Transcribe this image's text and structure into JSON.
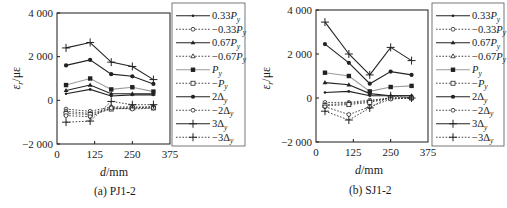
{
  "chart_data": [
    {
      "type": "line",
      "title": "(a) PJ1-2",
      "xlabel": "d/mm",
      "ylabel": "εr/με",
      "xlim": [
        0,
        375
      ],
      "ylim": [
        -2000,
        4000
      ],
      "xticks": [
        0,
        125,
        250,
        375
      ],
      "yticks": [
        -2000,
        0,
        2000,
        4000
      ],
      "ytick_labels": [
        "−2 000",
        "0",
        "2 000",
        "4 000"
      ],
      "grid": false,
      "legend_position": "right",
      "x": [
        30,
        110,
        180,
        250,
        320
      ],
      "series": [
        {
          "name": "0.33Py",
          "style": "solid",
          "marker": "dot",
          "values": [
            300,
            500,
            200,
            250,
            250
          ]
        },
        {
          "name": "-0.33Py",
          "style": "dotted",
          "marker": "open-circle",
          "values": [
            -400,
            -500,
            -300,
            -300,
            -300
          ]
        },
        {
          "name": "0.67Py",
          "style": "solid",
          "marker": "triangle",
          "values": [
            450,
            700,
            300,
            300,
            300
          ]
        },
        {
          "name": "-0.67Py",
          "style": "dotted",
          "marker": "open-triangle",
          "values": [
            -500,
            -600,
            -350,
            -350,
            -300
          ]
        },
        {
          "name": "Py",
          "style": "solid-gray",
          "marker": "square",
          "values": [
            700,
            1000,
            500,
            600,
            400
          ]
        },
        {
          "name": "-Py",
          "style": "dotted",
          "marker": "open-square",
          "values": [
            -600,
            -650,
            -400,
            -350,
            -350
          ]
        },
        {
          "name": "2Δy",
          "style": "solid",
          "marker": "filled-circle",
          "values": [
            1600,
            1850,
            1200,
            1100,
            750
          ]
        },
        {
          "name": "-2Δy",
          "style": "dotted",
          "marker": "open-circle",
          "values": [
            -700,
            -750,
            -350,
            -400,
            -350
          ]
        },
        {
          "name": "3Δy",
          "style": "solid",
          "marker": "plus",
          "values": [
            2400,
            2650,
            1750,
            1550,
            950
          ]
        },
        {
          "name": "-3Δy",
          "style": "dotted",
          "marker": "plus",
          "values": [
            -1000,
            -950,
            -50,
            -200,
            -200
          ]
        }
      ]
    },
    {
      "type": "line",
      "title": "(b) SJ1-2",
      "xlabel": "d/mm",
      "ylabel": "εr/με",
      "xlim": [
        0,
        375
      ],
      "ylim": [
        -2000,
        4000
      ],
      "xticks": [
        0,
        125,
        250,
        375
      ],
      "yticks": [
        -2000,
        0,
        2000,
        4000
      ],
      "ytick_labels": [
        "−2 000",
        "0",
        "2 000",
        "4 000"
      ],
      "grid": false,
      "legend_position": "right",
      "x": [
        30,
        110,
        180,
        250,
        320
      ],
      "series": [
        {
          "name": "0.33Py",
          "style": "solid",
          "marker": "dot",
          "values": [
            250,
            300,
            100,
            100,
            100
          ]
        },
        {
          "name": "-0.33Py",
          "style": "dotted",
          "marker": "open-circle",
          "values": [
            -200,
            -200,
            -100,
            0,
            0
          ]
        },
        {
          "name": "0.67Py",
          "style": "solid",
          "marker": "triangle",
          "values": [
            700,
            600,
            200,
            100,
            100
          ]
        },
        {
          "name": "-0.67Py",
          "style": "dotted",
          "marker": "open-triangle",
          "values": [
            -300,
            -250,
            -150,
            0,
            0
          ]
        },
        {
          "name": "Py",
          "style": "solid-gray",
          "marker": "square",
          "values": [
            1150,
            1000,
            300,
            500,
            550
          ]
        },
        {
          "name": "-Py",
          "style": "dotted",
          "marker": "open-square",
          "values": [
            -350,
            -300,
            -200,
            0,
            0
          ]
        },
        {
          "name": "2Δy",
          "style": "solid",
          "marker": "filled-circle",
          "values": [
            2450,
            1600,
            650,
            1200,
            1050
          ]
        },
        {
          "name": "-2Δy",
          "style": "dotted",
          "marker": "open-circle",
          "values": [
            -400,
            -750,
            -400,
            -50,
            0
          ]
        },
        {
          "name": "3Δy",
          "style": "solid",
          "marker": "plus",
          "values": [
            3450,
            2000,
            1050,
            2300,
            1700
          ]
        },
        {
          "name": "-3Δy",
          "style": "dotted",
          "marker": "plus",
          "values": [
            -600,
            -1000,
            -450,
            100,
            0
          ]
        }
      ]
    }
  ],
  "legend": {
    "entries": [
      {
        "coef": "0.33",
        "sym": "P",
        "sub": "y",
        "neg": false
      },
      {
        "coef": "0.33",
        "sym": "P",
        "sub": "y",
        "neg": true
      },
      {
        "coef": "0.67",
        "sym": "P",
        "sub": "y",
        "neg": false
      },
      {
        "coef": "0.67",
        "sym": "P",
        "sub": "y",
        "neg": true
      },
      {
        "coef": "",
        "sym": "P",
        "sub": "y",
        "neg": false
      },
      {
        "coef": "",
        "sym": "P",
        "sub": "y",
        "neg": true
      },
      {
        "coef": "2",
        "sym": "Δ",
        "sub": "y",
        "neg": false
      },
      {
        "coef": "2",
        "sym": "Δ",
        "sub": "y",
        "neg": true
      },
      {
        "coef": "3",
        "sym": "Δ",
        "sub": "y",
        "neg": false
      },
      {
        "coef": "3",
        "sym": "Δ",
        "sub": "y",
        "neg": true
      }
    ]
  },
  "panels": [
    {
      "caption": "(a) PJ1-2",
      "xlabel_var": "d",
      "xlabel_unit": "/mm",
      "ylabel_var": "ε",
      "ylabel_sub": "r",
      "ylabel_unit": "/με"
    },
    {
      "caption": "(b) SJ1-2",
      "xlabel_var": "d",
      "xlabel_unit": "/mm",
      "ylabel_var": "ε",
      "ylabel_sub": "r",
      "ylabel_unit": "/με"
    }
  ],
  "colors": {
    "axis": "#1a1a1a",
    "line": "#222222",
    "py_line": "#9a9a9a",
    "dotted": "#333333"
  }
}
